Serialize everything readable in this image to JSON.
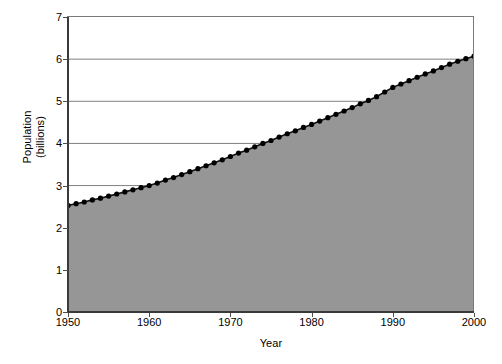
{
  "chart_data": {
    "type": "area",
    "title": "",
    "xlabel": "Year",
    "ylabel": "Population (billions)",
    "ylabel_line1": "Population",
    "ylabel_line2": "(billions)",
    "xlim": [
      1950,
      2000
    ],
    "ylim": [
      0,
      7
    ],
    "ytick_labels": [
      "0",
      "1",
      "2",
      "3",
      "4",
      "5",
      "6",
      "7"
    ],
    "ytick_values": [
      0,
      1,
      2,
      3,
      4,
      5,
      6,
      7
    ],
    "xtick_labels": [
      "1950",
      "1960",
      "1970",
      "1980",
      "1990",
      "2000"
    ],
    "xtick_values": [
      1950,
      1960,
      1970,
      1980,
      1990,
      2000
    ],
    "grid": "horizontal",
    "legend": "none",
    "marker": "filled-circle",
    "colors": {
      "fill": "#969696",
      "line": "#111111",
      "marker": "#000000",
      "grid": "#808080",
      "axis": "#3a3a3a",
      "background": "#ffffff"
    },
    "x": [
      1950,
      1951,
      1952,
      1953,
      1954,
      1955,
      1956,
      1957,
      1958,
      1959,
      1960,
      1961,
      1962,
      1963,
      1964,
      1965,
      1966,
      1967,
      1968,
      1969,
      1970,
      1971,
      1972,
      1973,
      1974,
      1975,
      1976,
      1977,
      1978,
      1979,
      1980,
      1981,
      1982,
      1983,
      1984,
      1985,
      1986,
      1987,
      1988,
      1989,
      1990,
      1991,
      1992,
      1993,
      1994,
      1995,
      1996,
      1997,
      1998,
      1999,
      2000
    ],
    "values": [
      2.53,
      2.57,
      2.61,
      2.66,
      2.7,
      2.75,
      2.8,
      2.85,
      2.9,
      2.95,
      3.0,
      3.06,
      3.13,
      3.19,
      3.26,
      3.33,
      3.4,
      3.47,
      3.54,
      3.61,
      3.69,
      3.77,
      3.84,
      3.92,
      4.0,
      4.07,
      4.15,
      4.23,
      4.3,
      4.38,
      4.45,
      4.53,
      4.61,
      4.69,
      4.77,
      4.85,
      4.94,
      5.02,
      5.11,
      5.22,
      5.33,
      5.41,
      5.49,
      5.57,
      5.65,
      5.72,
      5.8,
      5.88,
      5.95,
      6.01,
      6.07
    ],
    "series": [
      {
        "name": "World population",
        "values": [
          2.53,
          2.57,
          2.61,
          2.66,
          2.7,
          2.75,
          2.8,
          2.85,
          2.9,
          2.95,
          3.0,
          3.06,
          3.13,
          3.19,
          3.26,
          3.33,
          3.4,
          3.47,
          3.54,
          3.61,
          3.69,
          3.77,
          3.84,
          3.92,
          4.0,
          4.07,
          4.15,
          4.23,
          4.3,
          4.38,
          4.45,
          4.53,
          4.61,
          4.69,
          4.77,
          4.85,
          4.94,
          5.02,
          5.11,
          5.22,
          5.33,
          5.41,
          5.49,
          5.57,
          5.65,
          5.72,
          5.8,
          5.88,
          5.95,
          6.01,
          6.07
        ]
      }
    ]
  }
}
